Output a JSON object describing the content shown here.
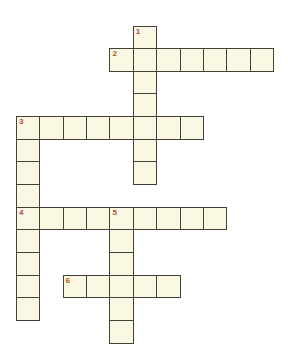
{
  "puzzle": {
    "type": "crossword",
    "rows": 14,
    "cols": 11,
    "colors": {
      "background": "#ffffff",
      "cell_fill": "#faf7e3",
      "cell_border": "#42423a",
      "number": "#b1502c"
    },
    "entries": [
      {
        "number": "1",
        "direction": "down",
        "row": 0,
        "col": 5,
        "length": 7
      },
      {
        "number": "2",
        "direction": "across",
        "row": 1,
        "col": 4,
        "length": 7
      },
      {
        "number": "3",
        "direction": "across",
        "row": 4,
        "col": 0,
        "length": 8
      },
      {
        "number": "3",
        "direction": "down",
        "row": 4,
        "col": 0,
        "length": 9
      },
      {
        "number": "4",
        "direction": "across",
        "row": 8,
        "col": 0,
        "length": 9
      },
      {
        "number": "5",
        "direction": "down",
        "row": 8,
        "col": 4,
        "length": 6
      },
      {
        "number": "6",
        "direction": "across",
        "row": 11,
        "col": 2,
        "length": 5
      }
    ]
  }
}
